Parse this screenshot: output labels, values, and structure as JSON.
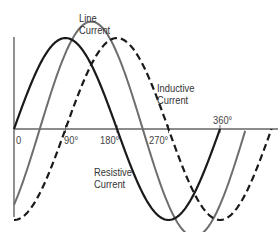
{
  "diagram": {
    "labels": {
      "line_current": [
        "Line",
        "Current"
      ],
      "inductive_current": [
        "Inductive",
        "Current"
      ],
      "resistive_current": [
        "Resistive",
        "Current"
      ]
    },
    "axis_ticks": [
      "0",
      "90°",
      "180°",
      "270°",
      "360°"
    ],
    "colors": {
      "resistive": "#1a1a1a",
      "inductive": "#1a1a1a",
      "line": "#6e6e6e",
      "axis": "#555555"
    },
    "series": [
      {
        "name": "Resistive Current",
        "style": "solid-black",
        "phase_deg": 0,
        "amplitude": 1.0
      },
      {
        "name": "Inductive Current",
        "style": "dashed-black",
        "phase_deg": -90,
        "amplitude": 1.0
      },
      {
        "name": "Line Current",
        "style": "solid-gray",
        "phase_deg": -45,
        "amplitude": 1.414
      }
    ]
  }
}
